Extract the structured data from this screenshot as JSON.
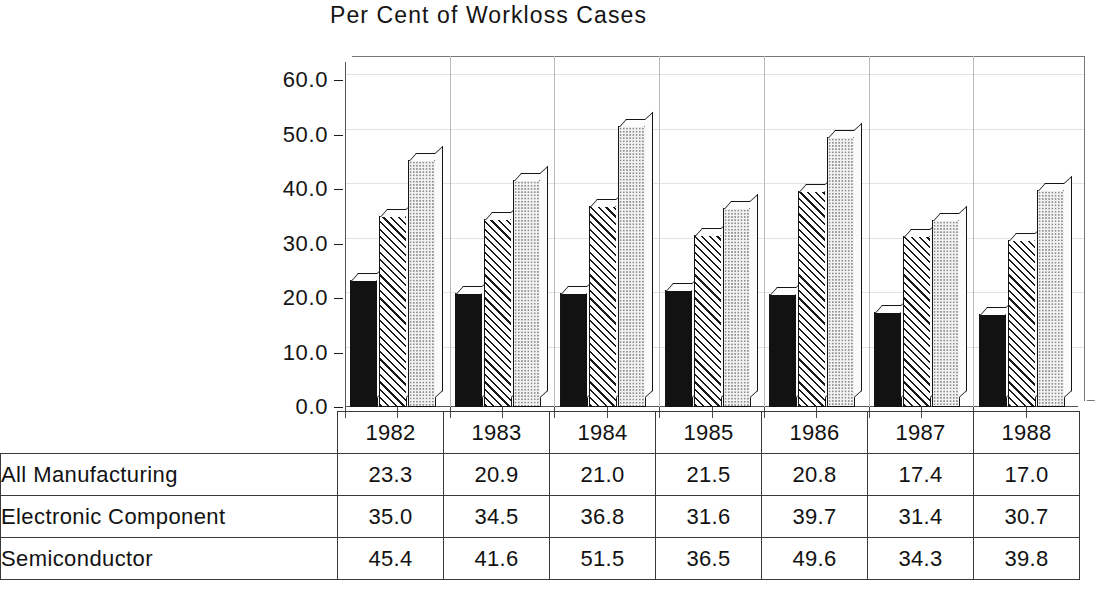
{
  "chart_data": {
    "type": "bar",
    "title": "Per Cent of Workloss Cases",
    "xlabel": "",
    "ylabel": "",
    "categories": [
      "1982",
      "1983",
      "1984",
      "1985",
      "1986",
      "1987",
      "1988"
    ],
    "series": [
      {
        "name": "All Manufacturing",
        "values": [
          23.3,
          20.9,
          21.0,
          21.5,
          20.8,
          17.4,
          17.0
        ],
        "fill": "solid-black"
      },
      {
        "name": "Electronic Component",
        "values": [
          35.0,
          34.5,
          36.8,
          31.6,
          39.7,
          31.4,
          30.7
        ],
        "fill": "diagonal-hatch"
      },
      {
        "name": "Semiconductor",
        "values": [
          45.4,
          41.6,
          51.5,
          36.5,
          49.6,
          34.3,
          39.8
        ],
        "fill": "light-dots"
      }
    ],
    "ylim": [
      0.0,
      60.0
    ],
    "ytick_labels": [
      "60.0",
      "50.0",
      "40.0",
      "30.0",
      "20.0",
      "10.0",
      "0.0"
    ],
    "ytick_values": [
      60.0,
      50.0,
      40.0,
      30.0,
      20.0,
      10.0,
      0.0
    ],
    "grid": true,
    "legend": "none (values shown in table below)"
  },
  "table": {
    "corner_label": "",
    "year_headers": [
      "1982",
      "1983",
      "1984",
      "1985",
      "1986",
      "1987",
      "1988"
    ],
    "rows": [
      {
        "label": "All Manufacturing",
        "values": [
          "23.3",
          "20.9",
          "21.0",
          "21.5",
          "20.8",
          "17.4",
          "17.0"
        ]
      },
      {
        "label": "Electronic Component",
        "values": [
          "35.0",
          "34.5",
          "36.8",
          "31.6",
          "39.7",
          "31.4",
          "30.7"
        ]
      },
      {
        "label": "Semiconductor",
        "values": [
          "45.4",
          "41.6",
          "51.5",
          "36.5",
          "49.6",
          "34.3",
          "39.8"
        ]
      }
    ]
  },
  "colors": {
    "ink": "#121212",
    "grid": "#e2e2e2",
    "frame": "#555555",
    "bar_solid": "#121212",
    "bar_dots_bg": "#f2f2f2"
  }
}
